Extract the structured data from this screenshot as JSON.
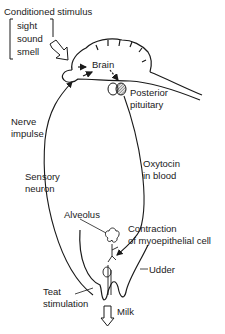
{
  "diagram": {
    "type": "milk-ejection-reflex",
    "labels": {
      "conditioned_stimulus": "Conditioned stimulus",
      "stimuli": [
        "sight",
        "sound",
        "smell"
      ],
      "brain": "Brain",
      "posterior_pituitary": [
        "Posterior",
        "pituitary"
      ],
      "nerve_impulse": [
        "Nerve",
        "impulse"
      ],
      "sensory_neuron": [
        "Sensory",
        "neuron"
      ],
      "oxytocin": [
        "Oxytocin",
        "in blood"
      ],
      "alveolus": "Alveolus",
      "contraction": [
        "Contraction",
        "of myoepithelial cell"
      ],
      "udder": "Udder",
      "teat_stimulation": [
        "Teat",
        "stimulation"
      ],
      "milk": "Milk"
    },
    "colors": {
      "line": "#1a1a1a",
      "background": "#ffffff"
    }
  }
}
